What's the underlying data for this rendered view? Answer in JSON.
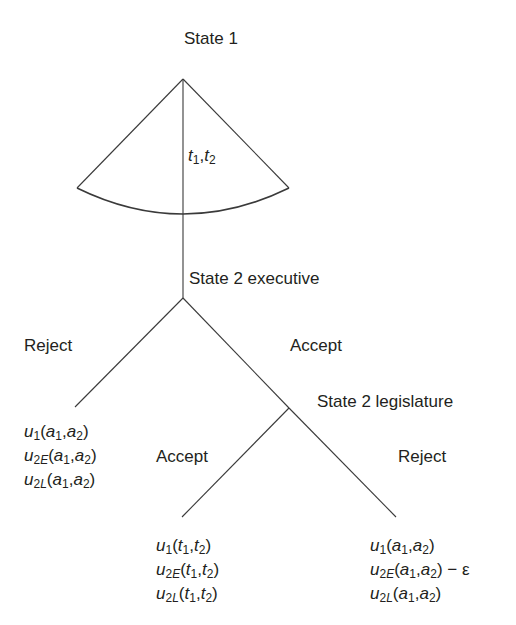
{
  "diagram": {
    "type": "extensive-form game tree",
    "nodes": {
      "state1": {
        "label": "State 1",
        "x": 183,
        "y": 79
      },
      "executive": {
        "label": "State 2 executive",
        "x": 183,
        "y": 298
      },
      "legislature": {
        "label": "State 2 legislature",
        "x": 289,
        "y": 408
      }
    },
    "choice_fan": {
      "label_var1": "t",
      "label_sub1": "1",
      "label_sep": ",",
      "label_var2": "t",
      "label_sub2": "2"
    },
    "executive_branches": {
      "reject_label": "Reject",
      "accept_label": "Accept"
    },
    "legislature_branches": {
      "accept_label": "Accept",
      "reject_label": "Reject"
    },
    "payoffs": {
      "exec_reject": [
        {
          "fn": "u",
          "sub": "1",
          "sub_it": "",
          "args": "(a1,a2)",
          "extra": ""
        },
        {
          "fn": "u",
          "sub": "2",
          "sub_it": "E",
          "args": "(a1,a2)",
          "extra": ""
        },
        {
          "fn": "u",
          "sub": "2",
          "sub_it": "L",
          "args": "(a1,a2)",
          "extra": ""
        }
      ],
      "leg_accept": [
        {
          "fn": "u",
          "sub": "1",
          "sub_it": "",
          "args": "(t1,t2)",
          "extra": ""
        },
        {
          "fn": "u",
          "sub": "2",
          "sub_it": "E",
          "args": "(t1,t2)",
          "extra": ""
        },
        {
          "fn": "u",
          "sub": "2",
          "sub_it": "L",
          "args": "(t1,t2)",
          "extra": ""
        }
      ],
      "leg_reject": [
        {
          "fn": "u",
          "sub": "1",
          "sub_it": "",
          "args": "(a1,a2)",
          "extra": ""
        },
        {
          "fn": "u",
          "sub": "2",
          "sub_it": "E",
          "args": "(a1,a2)",
          "extra": " − ε"
        },
        {
          "fn": "u",
          "sub": "2",
          "sub_it": "L",
          "args": "(a1,a2)",
          "extra": ""
        }
      ]
    },
    "colors": {
      "line": "#3a3a3a",
      "text": "#231f20",
      "background": "#ffffff"
    }
  }
}
